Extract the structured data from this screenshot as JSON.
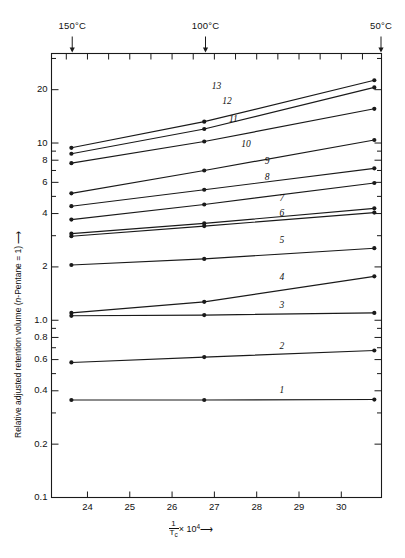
{
  "chart_data": {
    "type": "line",
    "title": "",
    "xlabel": "1/Tc x 10^4",
    "ylabel": "Relative adjusted retention volume (n-Pentane = 1)",
    "xlim": [
      23.15,
      30.95
    ],
    "ylim": [
      0.1,
      32.0
    ],
    "yscale": "log",
    "grid": false,
    "legend": "inline-right-labels",
    "x_ticks": [
      24,
      25,
      26,
      27,
      28,
      29,
      30
    ],
    "x_tick_labels": [
      "24",
      "25",
      "26",
      "27",
      "28",
      "29",
      "30"
    ],
    "y_ticks": [
      0.1,
      0.2,
      0.4,
      0.6,
      0.8,
      1.0,
      2,
      4,
      6,
      8,
      10,
      20
    ],
    "y_tick_labels": [
      "0.1",
      "0.2",
      "0.4",
      "0.6",
      "0.8",
      "1.0",
      "2",
      "4",
      "6",
      "8",
      "10",
      "20"
    ],
    "y_minor_ticks": [
      0.3,
      0.5,
      0.7,
      0.9,
      3,
      5,
      7,
      9,
      30
    ],
    "top_annotations": [
      {
        "label": "150°C",
        "x": 23.64
      },
      {
        "label": "100°C",
        "x": 26.79
      },
      {
        "label": "50°C",
        "x": 30.94
      }
    ],
    "x": [
      23.62,
      26.76,
      30.78
    ],
    "series": [
      {
        "name": "1",
        "label": "1",
        "values": [
          0.355,
          0.355,
          0.357
        ]
      },
      {
        "name": "2",
        "label": "2",
        "values": [
          0.578,
          0.62,
          0.675
        ]
      },
      {
        "name": "3",
        "label": "3",
        "values": [
          1.06,
          1.07,
          1.1
        ]
      },
      {
        "name": "4",
        "label": "4",
        "values": [
          1.1,
          1.27,
          1.77
        ]
      },
      {
        "name": "5",
        "label": "5",
        "values": [
          2.05,
          2.22,
          2.55
        ]
      },
      {
        "name": "6",
        "label": "6",
        "values": [
          2.98,
          3.4,
          4.05
        ]
      },
      {
        "name": "7",
        "label": "7",
        "values": [
          3.08,
          3.52,
          4.28
        ]
      },
      {
        "name": "8",
        "label": "8",
        "values": [
          3.7,
          4.5,
          5.95
        ]
      },
      {
        "name": "9",
        "label": "9",
        "values": [
          4.4,
          5.45,
          7.2
        ]
      },
      {
        "name": "10",
        "label": "10",
        "values": [
          5.2,
          7.0,
          10.4
        ]
      },
      {
        "name": "11",
        "label": "11",
        "values": [
          7.7,
          10.2,
          15.6
        ]
      },
      {
        "name": "12",
        "label": "12",
        "values": [
          8.7,
          12.0,
          20.6
        ]
      },
      {
        "name": "13",
        "label": "13",
        "values": [
          9.4,
          13.2,
          22.6
        ]
      }
    ],
    "curve_label_positions": [
      {
        "label": "1",
        "x": 28.55,
        "y": 0.395
      },
      {
        "label": "2",
        "x": 28.55,
        "y": 0.695
      },
      {
        "label": "3",
        "x": 28.55,
        "y": 1.19
      },
      {
        "label": "4",
        "x": 28.55,
        "y": 1.72
      },
      {
        "label": "5",
        "x": 28.55,
        "y": 2.75
      },
      {
        "label": "6",
        "x": 28.55,
        "y": 3.95
      },
      {
        "label": "7",
        "x": 28.55,
        "y": 4.75
      },
      {
        "label": "8",
        "x": 28.2,
        "y": 6.3
      },
      {
        "label": "9",
        "x": 28.2,
        "y": 7.7
      },
      {
        "label": "10",
        "x": 27.7,
        "y": 9.6
      },
      {
        "label": "11",
        "x": 27.4,
        "y": 13.3
      },
      {
        "label": "12",
        "x": 27.25,
        "y": 16.9
      },
      {
        "label": "13",
        "x": 27.0,
        "y": 20.4
      }
    ],
    "marker": "filled-circle",
    "line_color": "#1a1a1a",
    "axis_color": "#1a1a1a"
  },
  "axes": {
    "y_axis_title_prefix": "Relative adjusted retention volume (",
    "y_axis_title_italic": "n",
    "y_axis_title_suffix": "-Pentane = 1)",
    "y_axis_arrow": "⟶",
    "x_axis_numerator": "1",
    "x_axis_denominator": "T",
    "x_axis_denominator_sub": "c",
    "x_axis_mult": "× 10",
    "x_axis_exp": "4",
    "x_axis_arrow": "⟶"
  }
}
